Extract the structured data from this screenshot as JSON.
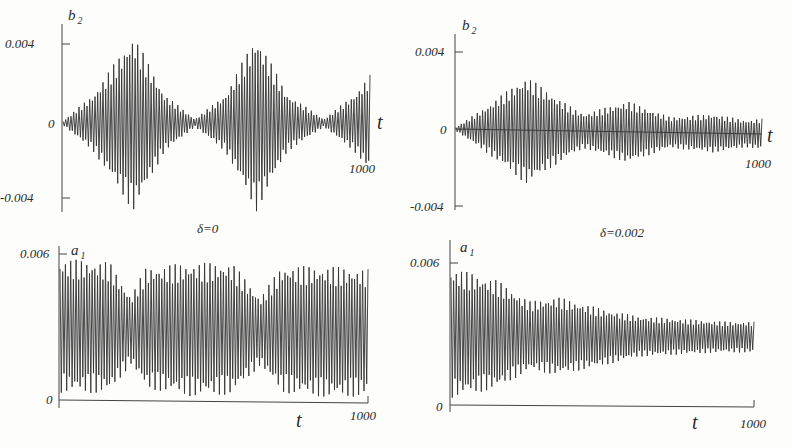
{
  "figure": {
    "panels": [
      {
        "id": "top-left",
        "ylabel_main": "b",
        "ylabel_sub": "2",
        "ytick_top": "0.004",
        "ytick_zero": "0",
        "ytick_bottom": "-0.004",
        "xlabel": "t",
        "xtick_end": "1000",
        "caption": "δ=0"
      },
      {
        "id": "top-right",
        "ylabel_main": "b",
        "ylabel_sub": "2",
        "ytick_top": "0.004",
        "ytick_zero": "0",
        "ytick_bottom": "-0.004",
        "xlabel": "t",
        "xtick_end": "1000",
        "caption": "δ=0.002"
      },
      {
        "id": "bottom-left",
        "ylabel_main": "a",
        "ylabel_sub": "1",
        "ytick_top": "0.006",
        "ytick_zero": "0",
        "xlabel": "t",
        "xtick_end": "1000"
      },
      {
        "id": "bottom-right",
        "ylabel_main": "a",
        "ylabel_sub": "1",
        "ytick_top": "0.006",
        "ytick_zero": "0",
        "xlabel": "t",
        "xtick_end": "1000"
      }
    ]
  },
  "chart_data": [
    {
      "type": "line",
      "title": "δ=0",
      "xlabel": "t",
      "ylabel": "b2",
      "xlim": [
        0,
        1000
      ],
      "ylim": [
        -0.0045,
        0.0045
      ],
      "yticks": [
        -0.004,
        0,
        0.004
      ],
      "xticks": [
        1000
      ],
      "description": "Fast oscillation with beating envelope; amplitude peaks ~0.0045 near t≈230 and t≈630, nodes near t≈0, t≈430, t≈850",
      "envelope": {
        "t": [
          0,
          100,
          230,
          330,
          430,
          530,
          630,
          730,
          850,
          950,
          1000
        ],
        "amplitude": [
          0.0001,
          0.0015,
          0.0046,
          0.0015,
          0.0002,
          0.0015,
          0.0046,
          0.0015,
          0.0002,
          0.0015,
          0.0025
        ]
      }
    },
    {
      "type": "line",
      "title": "δ=0.002",
      "xlabel": "t",
      "ylabel": "b2",
      "xlim": [
        0,
        1000
      ],
      "ylim": [
        -0.0045,
        0.0045
      ],
      "yticks": [
        -0.004,
        0,
        0.004
      ],
      "xticks": [
        1000
      ],
      "description": "Damped beating oscillation; envelope peaks ~0.0028 at t≈230, ~0.0016 at t≈560, ~0.0010 at t≈840",
      "envelope": {
        "t": [
          0,
          100,
          230,
          380,
          420,
          560,
          700,
          840,
          950,
          1000
        ],
        "amplitude": [
          0.0001,
          0.0012,
          0.0028,
          0.0012,
          0.0009,
          0.0016,
          0.0008,
          0.001,
          0.0007,
          0.0008
        ]
      }
    },
    {
      "type": "line",
      "title": "",
      "xlabel": "t",
      "ylabel": "a1",
      "xlim": [
        0,
        1000
      ],
      "ylim": [
        0,
        0.0065
      ],
      "yticks": [
        0,
        0.006
      ],
      "xticks": [
        1000
      ],
      "description": "Dense oscillation between ~0 and ~0.0057 with slow modulation; band narrows (0.0012–0.0045) near t≈230 and t≈650",
      "envelope": {
        "t": [
          0,
          160,
          230,
          280,
          430,
          560,
          650,
          720,
          880,
          1000
        ],
        "upper": [
          0.0058,
          0.0057,
          0.0043,
          0.0055,
          0.0057,
          0.0057,
          0.0043,
          0.0056,
          0.0056,
          0.0055
        ],
        "lower": [
          0.0003,
          0.0003,
          0.0015,
          0.0005,
          0.0002,
          0.0003,
          0.0015,
          0.0004,
          0.0002,
          0.0003
        ]
      }
    },
    {
      "type": "line",
      "title": "",
      "xlabel": "t",
      "ylabel": "a1",
      "xlim": [
        0,
        1000
      ],
      "ylim": [
        0,
        0.0065
      ],
      "yticks": [
        0,
        0.006
      ],
      "xticks": [
        1000
      ],
      "description": "Damped oscillation converging toward ~0.003; band shrinks from 0.0003–0.0058 at t=0 to ~0.0022–0.0036 at t=1000",
      "envelope": {
        "t": [
          0,
          150,
          260,
          350,
          500,
          620,
          760,
          900,
          1000
        ],
        "upper": [
          0.0058,
          0.0053,
          0.0044,
          0.0046,
          0.0041,
          0.0038,
          0.0037,
          0.0036,
          0.0036
        ],
        "lower": [
          0.0003,
          0.0007,
          0.0015,
          0.0013,
          0.0017,
          0.0021,
          0.0022,
          0.0023,
          0.0023
        ]
      }
    }
  ]
}
